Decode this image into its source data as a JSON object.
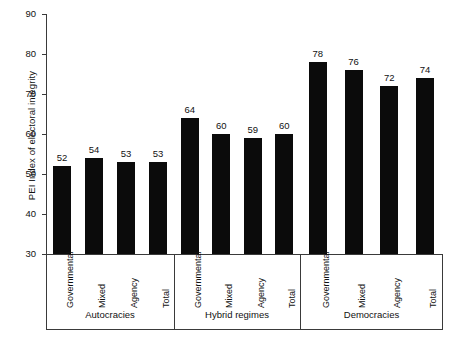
{
  "chart_data": {
    "type": "bar",
    "title": "",
    "xlabel": "",
    "ylabel": "PEI Index of electoral integrity",
    "ylim": [
      30,
      90
    ],
    "yticks": [
      30,
      40,
      50,
      60,
      70,
      80,
      90
    ],
    "grid": false,
    "legend": "none",
    "categories": [
      "Governmental",
      "Mixed",
      "Agency",
      "Total",
      "Governmental",
      "Mixed",
      "Agency",
      "Total",
      "Governmental",
      "Mixed",
      "Agency",
      "Total"
    ],
    "values": [
      52,
      54,
      53,
      53,
      64,
      60,
      59,
      60,
      78,
      76,
      72,
      74
    ],
    "groups": [
      {
        "name": "Autocracies",
        "categories": [
          "Governmental",
          "Mixed",
          "Agency",
          "Total"
        ],
        "values": [
          52,
          54,
          53,
          53
        ]
      },
      {
        "name": "Hybrid regimes",
        "categories": [
          "Governmental",
          "Mixed",
          "Agency",
          "Total"
        ],
        "values": [
          64,
          60,
          59,
          60
        ]
      },
      {
        "name": "Democracies",
        "categories": [
          "Governmental",
          "Mixed",
          "Agency",
          "Total"
        ],
        "values": [
          78,
          76,
          72,
          74
        ]
      }
    ],
    "bar_color": "#0b0b0b",
    "axis_color": "#3a3a3a",
    "background": "#ffffff"
  }
}
